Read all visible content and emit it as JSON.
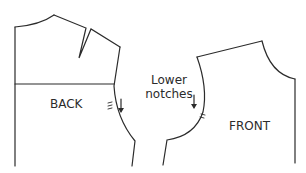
{
  "diagram": {
    "type": "sewing-pattern",
    "pieces": [
      {
        "id": "back",
        "label": "BACK"
      },
      {
        "id": "front",
        "label": "FRONT"
      }
    ],
    "annotation": {
      "line1": "Lower",
      "line2": "notches"
    },
    "colors": {
      "stroke": "#2b2b2b",
      "background": "#ffffff"
    }
  }
}
